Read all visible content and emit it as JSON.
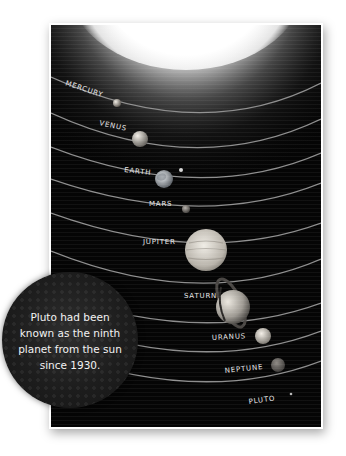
{
  "illustration": {
    "subject": "solar system",
    "sun_glow": "white",
    "planets": [
      {
        "name": "MERCURY",
        "color": "#b9b5ae"
      },
      {
        "name": "VENUS",
        "color": "#c9c4bc"
      },
      {
        "name": "EARTH",
        "color": "#bfc4c8"
      },
      {
        "name": "MARS",
        "color": "#8a8580"
      },
      {
        "name": "JUPITER",
        "color": "#d8d4cc"
      },
      {
        "name": "SATURN",
        "color": "#bdb8b0"
      },
      {
        "name": "URANUS",
        "color": "#d2cdc4"
      },
      {
        "name": "NEPTUNE",
        "color": "#6e6a66"
      },
      {
        "name": "PLUTO",
        "color": "#aaaaaa"
      }
    ],
    "earth_moon": true,
    "saturn_rings": true
  },
  "callout": {
    "lines": [
      "Pluto had been",
      "known as the ninth",
      "planet from the sun",
      "since 1930."
    ]
  },
  "colors": {
    "background": "#ffffff",
    "space": "#050505",
    "orbit": "#8e8e8e",
    "text": "#f2f2f2"
  }
}
